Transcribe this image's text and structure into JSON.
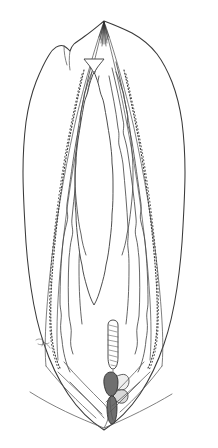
{
  "figure": {
    "domain": "scientific-line-drawing",
    "title": "",
    "caption": "",
    "label_text": "",
    "background_color": "#ffffff",
    "ink_color": "#3a3a3a",
    "canvas": {
      "width": 218,
      "height": 448
    },
    "orientation": "vertical",
    "style": "pen-and-ink stipple and contour line drawing, no text labels"
  },
  "structures": [
    {
      "id": "outer-body-wall",
      "name": "outer-body-outline",
      "description": "elongate ovoid / lanceolate outer contour, pointed at top apex and bottom base",
      "stroke": "#3a3a3a",
      "fill": "#ffffff",
      "extent": {
        "left": 21,
        "right": 199,
        "top": 21,
        "bottom": 430
      }
    },
    {
      "id": "shoulder-notch",
      "name": "upper-left-shoulder-notch",
      "description": "small angular notch on the upper-left margin",
      "position": {
        "x": 72,
        "y": 45
      }
    },
    {
      "id": "inner-chamber",
      "name": "inner-chamber-outline",
      "description": "central elongate chamber with pointed arched apex and crenulate margins",
      "stroke": "#444",
      "fill": "#ffffff"
    },
    {
      "id": "stipple-band-left",
      "name": "left-stippled-band",
      "description": "dotted/stippled longitudinal band along the left inner flank"
    },
    {
      "id": "stipple-band-right",
      "name": "right-stippled-band",
      "description": "dotted/stippled longitudinal band along the right inner flank"
    },
    {
      "id": "wavy-lines-left",
      "name": "left-wavy-contour-lines",
      "description": "two to three parallel crenulate contour lines on the left"
    },
    {
      "id": "wavy-lines-right",
      "name": "right-wavy-contour-lines",
      "description": "two to three parallel crenulate contour lines on the right"
    },
    {
      "id": "apex-tuft",
      "name": "apical-tuft",
      "description": "dense dark tuft of fine converging lines at the top apex",
      "position": {
        "x": 104,
        "y": 27
      }
    },
    {
      "id": "capsule",
      "name": "basal-capsule",
      "description": "elongate club-shaped capsule with fine internal hatching, hanging above the basal organ",
      "position": {
        "x": 113,
        "y": 322
      },
      "size": {
        "width": 14,
        "height": 52
      }
    },
    {
      "id": "basal-organ-dark",
      "name": "basal-dark-organ",
      "description": "dark shaded rounded organ at the base of the chamber",
      "fill": "#6f6f6f",
      "position": {
        "x": 111,
        "y": 381
      }
    },
    {
      "id": "basal-organ-pale",
      "name": "basal-pale-lobe",
      "description": "pale rounded lobe adjacent and to the right of the dark organ",
      "fill": "#efefef",
      "position": {
        "x": 124,
        "y": 383
      }
    },
    {
      "id": "basal-stalk",
      "name": "basal-elongate-stalk",
      "description": "narrow elongate shaded stalk descending from the basal organ toward the bottom apex",
      "position": {
        "x": 112,
        "y": 404
      }
    },
    {
      "id": "side-mark",
      "name": "left-margin-sketch-mark",
      "description": "small sketchy attachment mark on the lower-left outer margin",
      "position": {
        "x": 40,
        "y": 342
      }
    },
    {
      "id": "basal-converging-lines",
      "name": "basal-converging-lines",
      "description": "contour lines converging to the bottom apex"
    }
  ],
  "colors": {
    "background": "#ffffff",
    "primary_ink": "#3a3a3a",
    "light_ink": "#555555",
    "dark_shade": "#6f6f6f",
    "pale_shade": "#efefef"
  }
}
